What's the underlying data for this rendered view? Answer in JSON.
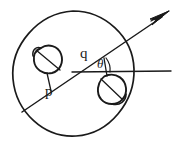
{
  "figure": {
    "background_color": "#ffffff",
    "ink_color": "#1a1a1a",
    "labels": {
      "p": "p",
      "q": "q",
      "theta": "θ"
    },
    "elements": {
      "outer_circle": "large hand-drawn circle",
      "blob_upper_left": "small irregular blob with chord",
      "blob_lower_right": "small irregular blob with chord",
      "diagonal_arrow": "long diagonal line with arrowhead pointing upper right",
      "horizontal_ray": "horizontal line extending to the right edge",
      "segment_p": "short segment from upper-left blob to point p on the diagonal",
      "segment_q": "short segment from point q on the diagonal down to the lower-right blob",
      "angle_arc": "small arc marking the angle theta"
    },
    "geometry": {
      "outer_circle_center_x": 73,
      "outer_circle_center_y": 72,
      "outer_circle_radius": 61,
      "diagonal_start_x": 22,
      "diagonal_start_y": 112,
      "diagonal_end_x": 169,
      "diagonal_end_y": 12,
      "horizontal_y": 72,
      "horizontal_start_x": 72,
      "horizontal_end_x": 171,
      "angle_vertex_x": 93,
      "angle_vertex_y": 64,
      "point_p_x": 52,
      "point_p_y": 92,
      "point_q_x": 103,
      "point_q_y": 57
    }
  }
}
